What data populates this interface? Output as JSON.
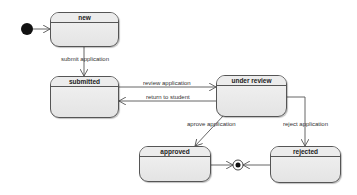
{
  "diagram": {
    "type": "state-machine",
    "states": [
      {
        "id": "new",
        "label": "new",
        "x": 50,
        "y": 12,
        "w": 69,
        "h": 35
      },
      {
        "id": "submitted",
        "label": "submitted",
        "x": 50,
        "y": 76,
        "w": 69,
        "h": 42
      },
      {
        "id": "under_review",
        "label": "under review",
        "x": 216,
        "y": 75,
        "w": 71,
        "h": 42
      },
      {
        "id": "approved",
        "label": "approved",
        "x": 139,
        "y": 146,
        "w": 72,
        "h": 36
      },
      {
        "id": "rejected",
        "label": "rejected",
        "x": 270,
        "y": 146,
        "w": 71,
        "h": 37
      }
    ],
    "transitions": [
      {
        "from": "initial",
        "to": "new",
        "label": ""
      },
      {
        "from": "new",
        "to": "submitted",
        "label": "submit application"
      },
      {
        "from": "submitted",
        "to": "under_review",
        "label": "review application"
      },
      {
        "from": "under_review",
        "to": "submitted",
        "label": "return to student"
      },
      {
        "from": "under_review",
        "to": "approved",
        "label": "aprove application"
      },
      {
        "from": "under_review",
        "to": "rejected",
        "label": "reject application"
      },
      {
        "from": "approved",
        "to": "final",
        "label": ""
      },
      {
        "from": "rejected",
        "to": "final",
        "label": ""
      }
    ],
    "labels": {
      "submit": "submit application",
      "review": "review application",
      "return": "return to student",
      "approve": "aprove application",
      "reject": "reject application"
    },
    "colors": {
      "line": "#555555",
      "fill": "#ececec",
      "node": "#111111"
    }
  }
}
